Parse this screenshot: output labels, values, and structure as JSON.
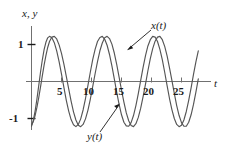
{
  "chart_data": {
    "type": "line",
    "title": "",
    "subtitle": "",
    "xlabel": "t",
    "ylabel": "x, y",
    "xlim": [
      -0.5,
      28.5
    ],
    "ylim": [
      -1.45,
      1.45
    ],
    "grid": false,
    "legend_position": "inline-annotation",
    "x_ticks": [
      5,
      10,
      15,
      20,
      25
    ],
    "x_tick_labels": [
      "5",
      "10",
      "15",
      "20",
      "25"
    ],
    "y_ticks": [
      1,
      -1
    ],
    "y_tick_labels": [
      "1",
      "-1"
    ],
    "annotations": [
      {
        "text": "x(t)",
        "target_x": 15.4,
        "target_y": 0.85
      },
      {
        "text": "y(t)",
        "target_x": 13.6,
        "target_y": -0.55
      }
    ],
    "series": [
      {
        "name": "x(t)",
        "color": "#555555",
        "amplitude": 1.22,
        "values_note": "x(t) = 1.22*sin(1.10*t - 1.45), beating with y(t)",
        "points": [
          [
            0.0,
            -1.21
          ],
          [
            0.3,
            -1.05
          ],
          [
            0.6,
            -0.8
          ],
          [
            0.9,
            -0.48
          ],
          [
            1.2,
            -0.12
          ],
          [
            1.5,
            0.25
          ],
          [
            1.8,
            0.58
          ],
          [
            2.1,
            0.86
          ],
          [
            2.4,
            1.06
          ],
          [
            2.7,
            1.18
          ],
          [
            3.0,
            1.22
          ],
          [
            3.4,
            1.18
          ],
          [
            3.8,
            1.05
          ],
          [
            4.2,
            0.83
          ],
          [
            4.6,
            0.54
          ],
          [
            5.0,
            0.2
          ],
          [
            5.4,
            -0.16
          ],
          [
            5.8,
            -0.51
          ],
          [
            6.2,
            -0.8
          ],
          [
            6.6,
            -1.03
          ],
          [
            7.0,
            -1.17
          ],
          [
            7.4,
            -1.22
          ],
          [
            7.8,
            -1.16
          ],
          [
            8.2,
            -1.01
          ],
          [
            8.6,
            -0.77
          ],
          [
            9.0,
            -0.46
          ],
          [
            9.4,
            -0.11
          ],
          [
            9.8,
            0.25
          ],
          [
            10.2,
            0.59
          ],
          [
            10.6,
            0.87
          ],
          [
            11.0,
            1.08
          ],
          [
            11.4,
            1.19
          ],
          [
            11.8,
            1.22
          ],
          [
            12.2,
            1.14
          ],
          [
            12.6,
            0.98
          ],
          [
            13.0,
            0.73
          ],
          [
            13.4,
            0.42
          ],
          [
            13.8,
            0.07
          ],
          [
            14.2,
            -0.29
          ],
          [
            14.6,
            -0.62
          ],
          [
            15.0,
            -0.9
          ],
          [
            15.4,
            -1.1
          ],
          [
            15.8,
            -1.2
          ],
          [
            16.2,
            -1.21
          ],
          [
            16.6,
            -1.11
          ],
          [
            17.0,
            -0.92
          ],
          [
            17.4,
            -0.65
          ],
          [
            17.8,
            -0.33
          ],
          [
            18.2,
            0.03
          ],
          [
            18.6,
            0.38
          ],
          [
            19.0,
            0.7
          ],
          [
            19.4,
            0.96
          ],
          [
            19.8,
            1.13
          ],
          [
            20.2,
            1.22
          ],
          [
            20.6,
            1.2
          ],
          [
            21.0,
            1.08
          ],
          [
            21.4,
            0.87
          ],
          [
            21.8,
            0.59
          ],
          [
            22.2,
            0.25
          ],
          [
            22.6,
            -0.11
          ],
          [
            23.0,
            -0.46
          ],
          [
            23.4,
            -0.76
          ],
          [
            23.8,
            -1.0
          ],
          [
            24.2,
            -1.16
          ],
          [
            24.6,
            -1.22
          ],
          [
            25.0,
            -1.18
          ],
          [
            25.4,
            -1.04
          ],
          [
            25.8,
            -0.81
          ],
          [
            26.2,
            -0.51
          ],
          [
            26.6,
            -0.17
          ],
          [
            27.0,
            0.19
          ],
          [
            27.4,
            0.53
          ],
          [
            27.8,
            0.83
          ]
        ]
      },
      {
        "name": "y(t)",
        "color": "#555555",
        "amplitude": 1.22,
        "values_note": "y(t) = 1.22*sin(0.95*t - 1.30), slower mode",
        "points": [
          [
            0.0,
            -1.18
          ],
          [
            0.3,
            -1.08
          ],
          [
            0.6,
            -0.92
          ],
          [
            0.9,
            -0.7
          ],
          [
            1.2,
            -0.44
          ],
          [
            1.5,
            -0.15
          ],
          [
            1.8,
            0.15
          ],
          [
            2.1,
            0.44
          ],
          [
            2.4,
            0.7
          ],
          [
            2.7,
            0.92
          ],
          [
            3.0,
            1.08
          ],
          [
            3.4,
            1.2
          ],
          [
            3.8,
            1.22
          ],
          [
            4.2,
            1.15
          ],
          [
            4.6,
            0.99
          ],
          [
            5.0,
            0.76
          ],
          [
            5.4,
            0.47
          ],
          [
            5.8,
            0.14
          ],
          [
            6.2,
            -0.2
          ],
          [
            6.6,
            -0.53
          ],
          [
            7.0,
            -0.82
          ],
          [
            7.4,
            -1.04
          ],
          [
            7.8,
            -1.18
          ],
          [
            8.2,
            -1.22
          ],
          [
            8.6,
            -1.16
          ],
          [
            9.0,
            -1.01
          ],
          [
            9.4,
            -0.78
          ],
          [
            9.8,
            -0.48
          ],
          [
            10.2,
            -0.14
          ],
          [
            10.6,
            0.21
          ],
          [
            11.0,
            0.54
          ],
          [
            11.4,
            0.83
          ],
          [
            11.8,
            1.04
          ],
          [
            12.2,
            1.18
          ],
          [
            12.6,
            1.22
          ],
          [
            13.0,
            1.16
          ],
          [
            13.4,
            1.01
          ],
          [
            13.8,
            0.77
          ],
          [
            14.2,
            0.46
          ],
          [
            14.6,
            0.12
          ],
          [
            15.0,
            -0.23
          ],
          [
            15.4,
            -0.56
          ],
          [
            15.8,
            -0.85
          ],
          [
            16.2,
            -1.06
          ],
          [
            16.6,
            -1.19
          ],
          [
            17.0,
            -1.22
          ],
          [
            17.4,
            -1.14
          ],
          [
            17.8,
            -0.97
          ],
          [
            18.2,
            -0.72
          ],
          [
            18.6,
            -0.41
          ],
          [
            19.0,
            -0.07
          ],
          [
            19.4,
            0.29
          ],
          [
            19.8,
            0.62
          ],
          [
            20.2,
            0.89
          ],
          [
            20.6,
            1.09
          ],
          [
            21.0,
            1.2
          ],
          [
            21.4,
            1.22
          ],
          [
            21.8,
            1.13
          ],
          [
            22.2,
            0.95
          ],
          [
            22.6,
            0.69
          ],
          [
            23.0,
            0.37
          ],
          [
            23.4,
            0.03
          ],
          [
            23.8,
            -0.32
          ],
          [
            24.2,
            -0.65
          ],
          [
            24.6,
            -0.92
          ],
          [
            25.0,
            -1.11
          ],
          [
            25.4,
            -1.21
          ],
          [
            25.8,
            -1.21
          ],
          [
            26.2,
            -1.1
          ],
          [
            26.6,
            -0.9
          ],
          [
            27.0,
            -0.62
          ],
          [
            27.4,
            -0.29
          ],
          [
            27.8,
            0.07
          ]
        ]
      }
    ]
  },
  "axes": {
    "y_axis_title": "x, y",
    "x_axis_title": "t",
    "y_tick_top_label": "1",
    "y_tick_bottom_label": "-1"
  },
  "labels": {
    "x_curve": "x(t)",
    "y_curve": "y(t)",
    "tick_5": "5",
    "tick_10": "10",
    "tick_15": "15",
    "tick_20": "20",
    "tick_25": "25"
  },
  "colors": {
    "curve": "#555555",
    "axis": "#707070",
    "text": "#1a1a1a",
    "background": "#ffffff"
  }
}
